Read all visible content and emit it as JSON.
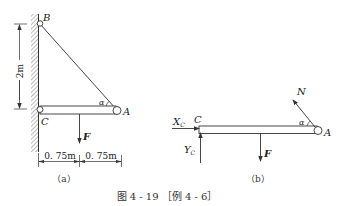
{
  "figure": {
    "caption": "图 4 - 19 ［例 4 - 6］",
    "colors": {
      "line": "#333333",
      "hatch": "#666666",
      "background": "#ffffff"
    }
  },
  "panel_a": {
    "label": "（a）",
    "points": {
      "B": "B",
      "C": "C",
      "A": "A"
    },
    "angle": "α",
    "force": "F",
    "height_dim": "2m",
    "span_dims": [
      "0. 75m",
      "0. 75m"
    ]
  },
  "panel_b": {
    "label": "（b）",
    "points": {
      "C": "C",
      "A": "A"
    },
    "angle": "α",
    "forces": {
      "N": "N",
      "F": "F",
      "Xc_main": "X",
      "Xc_sub": "C",
      "Yc_main": "Y",
      "Yc_sub": "C"
    }
  }
}
